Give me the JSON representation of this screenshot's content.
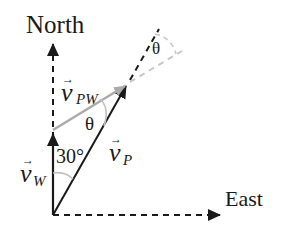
{
  "diagram": {
    "labels": {
      "north": "North",
      "east": "East",
      "v_pw_base": "v",
      "v_pw_sub": "PW",
      "v_p_base": "v",
      "v_p_sub": "P",
      "v_w_base": "v",
      "v_w_sub": "W",
      "angle_30": "30°",
      "theta_inner": "θ",
      "theta_outer": "θ",
      "vector_arrow": "→"
    },
    "colors": {
      "black": "#1a1a1a",
      "gray": "#aaaaaa",
      "light_gray": "#c8c8c8"
    }
  }
}
